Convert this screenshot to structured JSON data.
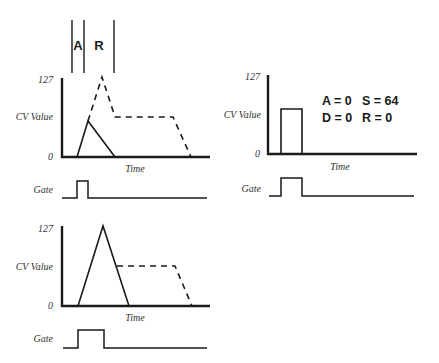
{
  "figure": {
    "phase_markers": {
      "labels": [
        "A",
        "R"
      ]
    },
    "panels": [
      {
        "id": "top-left",
        "y_max_label": "127",
        "y_label": "CV Value",
        "y_min_label": "0",
        "x_label": "Time",
        "gate_label": "Gate",
        "description": "Short gate: attack interrupted before reaching peak, release begins immediately; dashed shows full ADSR"
      },
      {
        "id": "top-right",
        "y_max_label": "127",
        "y_label": "CV Value",
        "y_min_label": "0",
        "x_label": "Time",
        "gate_label": "Gate",
        "params": {
          "a": "A = 0",
          "s": "S = 64",
          "d": "D = 0",
          "r": "R = 0"
        },
        "description": "Gate-shaped envelope: instant attack to sustain level, instant release"
      },
      {
        "id": "bottom-left",
        "y_max_label": "127",
        "y_label": "CV Value",
        "y_min_label": "0",
        "x_label": "Time",
        "gate_label": "Gate",
        "description": "Longer gate: attack reaches peak then releases; dashed shows sustain segment"
      }
    ]
  },
  "colors": {
    "ink": "#1a1a1a",
    "label": "#333333",
    "background": "#ffffff"
  }
}
